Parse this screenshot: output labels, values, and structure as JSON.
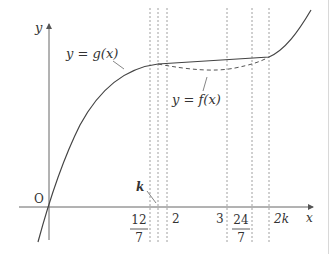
{
  "diagram": {
    "axes": {
      "x_label": "x",
      "y_label": "y",
      "origin_label": "O"
    },
    "curve_labels": {
      "g": "y = g(x)",
      "f": "y = f(x)"
    },
    "k_label": "k",
    "x_ticks": [
      {
        "id": "twelve-sevenths",
        "num": "12",
        "den": "7",
        "value": 1.714
      },
      {
        "id": "k",
        "label": "k",
        "value": 1.857
      },
      {
        "id": "two",
        "label": "2",
        "value": 2
      },
      {
        "id": "three",
        "label": "3",
        "value": 3
      },
      {
        "id": "twenty-four-sevenths",
        "num": "24",
        "den": "7",
        "value": 3.429
      },
      {
        "id": "two-k",
        "label": "2k",
        "value": 3.714
      }
    ],
    "colors": {
      "line": "#444444",
      "dashed": "#555555",
      "guide": "#888888"
    }
  }
}
